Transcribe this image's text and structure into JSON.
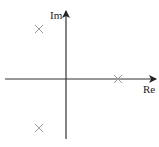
{
  "diagram": {
    "type": "pole-zero-plot",
    "axes": {
      "imaginary_label": "Im",
      "real_label": "Re"
    },
    "poles": [
      {
        "name": "pole-upper-left",
        "marker": "x"
      },
      {
        "name": "pole-lower-left",
        "marker": "x"
      },
      {
        "name": "pole-real-axis",
        "marker": "x"
      }
    ],
    "colors": {
      "axis": "#333333",
      "pole_marker": "#9a9a9a",
      "background": "#ffffff"
    }
  }
}
